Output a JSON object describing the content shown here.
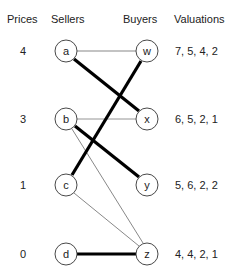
{
  "headers": {
    "prices": "Prices",
    "sellers": "Sellers",
    "buyers": "Buyers",
    "valuations": "Valuations"
  },
  "rows": [
    {
      "price": "4",
      "seller": "a",
      "buyer": "w",
      "valuations": "7, 5, 4, 2"
    },
    {
      "price": "3",
      "seller": "b",
      "buyer": "x",
      "valuations": "6, 5, 2, 1"
    },
    {
      "price": "1",
      "seller": "c",
      "buyer": "y",
      "valuations": "5, 6, 2, 2"
    },
    {
      "price": "0",
      "seller": "d",
      "buyer": "z",
      "valuations": "4, 4, 2, 1"
    }
  ],
  "edges": {
    "preferred_seller_graph": [
      {
        "from": "a",
        "to": "w",
        "style": "thin"
      },
      {
        "from": "a",
        "to": "x",
        "style": "thick"
      },
      {
        "from": "b",
        "to": "x",
        "style": "thin"
      },
      {
        "from": "b",
        "to": "y",
        "style": "thick"
      },
      {
        "from": "b",
        "to": "z",
        "style": "thin"
      },
      {
        "from": "c",
        "to": "w",
        "style": "thick"
      },
      {
        "from": "c",
        "to": "z",
        "style": "thin"
      },
      {
        "from": "d",
        "to": "z",
        "style": "thick"
      }
    ]
  }
}
